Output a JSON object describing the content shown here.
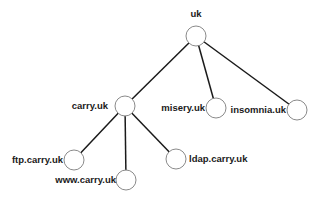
{
  "diagram": {
    "type": "tree",
    "title": "",
    "nodes": [
      {
        "id": "uk",
        "label": "uk",
        "x": 196,
        "y": 36,
        "lx": 196,
        "ly": 17,
        "anchor": "middle"
      },
      {
        "id": "carry",
        "label": "carry.uk",
        "x": 125,
        "y": 106,
        "lx": 108,
        "ly": 109,
        "anchor": "end"
      },
      {
        "id": "misery",
        "label": "misery.uk",
        "x": 216,
        "y": 108,
        "lx": 205,
        "ly": 111,
        "anchor": "end"
      },
      {
        "id": "insomnia",
        "label": "insomnia.uk",
        "x": 297,
        "y": 110,
        "lx": 286,
        "ly": 113,
        "anchor": "end"
      },
      {
        "id": "ftp",
        "label": "ftp.carry.uk",
        "x": 74,
        "y": 160,
        "lx": 63,
        "ly": 163,
        "anchor": "end"
      },
      {
        "id": "www",
        "label": "www.carry.uk",
        "x": 126,
        "y": 180,
        "lx": 116,
        "ly": 183,
        "anchor": "end"
      },
      {
        "id": "ldap",
        "label": "ldap.carry.uk",
        "x": 176,
        "y": 159,
        "lx": 189,
        "ly": 162,
        "anchor": "start"
      }
    ],
    "edges": [
      {
        "from": "uk",
        "to": "carry"
      },
      {
        "from": "uk",
        "to": "misery"
      },
      {
        "from": "uk",
        "to": "insomnia"
      },
      {
        "from": "carry",
        "to": "ftp"
      },
      {
        "from": "carry",
        "to": "www"
      },
      {
        "from": "carry",
        "to": "ldap"
      }
    ],
    "node_radius": 10,
    "colors": {
      "edge": "#1a1a1a",
      "node_stroke": "#8a8a8a",
      "node_fill": "#ffffff",
      "text": "#1a1a1a"
    }
  }
}
